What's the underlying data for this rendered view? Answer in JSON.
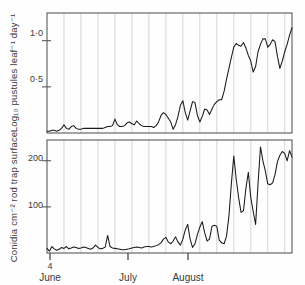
{
  "figure": {
    "background": "#fefefe",
    "line_color": "#1a1a1a",
    "grid_color": "#c4c4c4",
    "frame_color": "#4a4a4a"
  },
  "xaxis": {
    "month_labels": [
      "June",
      "July",
      "August"
    ],
    "day_label": "4",
    "tick_positions_px": [
      50,
      128,
      188
    ],
    "range_label": "4 June - September"
  },
  "panels": [
    {
      "id": "pustules",
      "ylabel": "Log₁₀ pustules leaf⁻¹ day⁻¹",
      "yticks": [
        "0·5",
        "1·0"
      ],
      "ytick_values": [
        0.5,
        1.0
      ]
    },
    {
      "id": "conidia",
      "ylabel": "Conidia cm⁻² rod trap surface",
      "yticks": [
        "100",
        "200"
      ],
      "ytick_values": [
        100,
        200
      ]
    }
  ],
  "chart_data": [
    {
      "type": "line",
      "title": "",
      "xlabel": "",
      "ylabel": "Log10 pustules leaf-1 day-1",
      "xlim": [
        0,
        101
      ],
      "ylim": [
        0,
        1.3
      ],
      "yticks": [
        0.5,
        1.0
      ],
      "ytick_labels": [
        "0·5",
        "1·0"
      ],
      "grid": "vertical-weekly",
      "legend": "none",
      "xtick_labels": [
        "4 June",
        "July",
        "August"
      ],
      "xtick_values": [
        0,
        27,
        58
      ],
      "x": [
        0,
        1,
        2,
        3,
        4,
        5,
        6,
        7,
        8,
        9,
        10,
        11,
        12,
        13,
        14,
        15,
        16,
        17,
        18,
        19,
        20,
        21,
        22,
        23,
        24,
        25,
        26,
        27,
        28,
        29,
        30,
        31,
        32,
        33,
        34,
        35,
        36,
        37,
        38,
        39,
        40,
        41,
        42,
        43,
        44,
        45,
        46,
        47,
        48,
        49,
        50,
        51,
        52,
        53,
        54,
        55,
        56,
        57,
        58,
        59,
        60,
        61,
        62,
        63,
        64,
        65,
        66,
        67,
        68,
        69,
        70,
        71,
        72,
        73,
        74,
        75,
        76,
        77,
        78,
        79,
        80,
        81,
        82,
        83,
        84,
        85,
        86,
        87,
        88,
        89,
        90,
        91,
        92,
        93,
        94,
        95,
        96,
        97,
        98,
        99,
        100,
        101
      ],
      "values": [
        0.02,
        0.02,
        0.03,
        0.03,
        0.02,
        0.03,
        0.05,
        0.09,
        0.05,
        0.04,
        0.07,
        0.08,
        0.05,
        0.04,
        0.04,
        0.05,
        0.05,
        0.05,
        0.05,
        0.05,
        0.05,
        0.05,
        0.05,
        0.05,
        0.06,
        0.07,
        0.07,
        0.08,
        0.15,
        0.09,
        0.07,
        0.07,
        0.08,
        0.11,
        0.12,
        0.1,
        0.09,
        0.13,
        0.1,
        0.08,
        0.07,
        0.07,
        0.07,
        0.07,
        0.06,
        0.08,
        0.12,
        0.19,
        0.22,
        0.2,
        0.16,
        0.12,
        0.04,
        0.09,
        0.18,
        0.3,
        0.35,
        0.22,
        0.14,
        0.24,
        0.34,
        0.33,
        0.19,
        0.12,
        0.18,
        0.26,
        0.25,
        0.2,
        0.26,
        0.31,
        0.34,
        0.36,
        0.36,
        0.45,
        0.58,
        0.7,
        0.82,
        0.93,
        0.97,
        0.95,
        0.94,
        0.98,
        0.92,
        0.84,
        0.78,
        0.66,
        0.72,
        0.88,
        0.96,
        1.02,
        1.02,
        0.93,
        0.96,
        1.01,
        0.99,
        0.83,
        0.7,
        0.78,
        0.88,
        0.96,
        1.06,
        1.14
      ]
    },
    {
      "type": "line",
      "title": "",
      "xlabel": "",
      "ylabel": "Conidia cm-2 rod trap surface",
      "xlim": [
        0,
        101
      ],
      "ylim": [
        0,
        245
      ],
      "yticks": [
        100,
        200
      ],
      "ytick_labels": [
        "100",
        "200"
      ],
      "grid": "vertical-weekly",
      "legend": "none",
      "xtick_labels": [
        "4 June",
        "July",
        "August"
      ],
      "xtick_values": [
        0,
        27,
        58
      ],
      "x": [
        0,
        1,
        2,
        3,
        4,
        5,
        6,
        7,
        8,
        9,
        10,
        11,
        12,
        13,
        14,
        15,
        16,
        17,
        18,
        19,
        20,
        21,
        22,
        23,
        24,
        25,
        26,
        27,
        28,
        29,
        30,
        31,
        32,
        33,
        34,
        35,
        36,
        37,
        38,
        39,
        40,
        41,
        42,
        43,
        44,
        45,
        46,
        47,
        48,
        49,
        50,
        51,
        52,
        53,
        54,
        55,
        56,
        57,
        58,
        59,
        60,
        61,
        62,
        63,
        64,
        65,
        66,
        67,
        68,
        69,
        70,
        71,
        72,
        73,
        74,
        75,
        76,
        77,
        78,
        79,
        80,
        81,
        82,
        83,
        84,
        85,
        86,
        87,
        88,
        89,
        90,
        91,
        92,
        93,
        94,
        95,
        96,
        97,
        98,
        99,
        100,
        101
      ],
      "values": [
        10,
        4,
        14,
        9,
        6,
        8,
        12,
        10,
        14,
        9,
        11,
        13,
        12,
        10,
        11,
        13,
        12,
        10,
        8,
        11,
        17,
        12,
        9,
        10,
        13,
        38,
        14,
        11,
        10,
        9,
        8,
        7,
        7,
        8,
        9,
        11,
        12,
        13,
        12,
        11,
        13,
        14,
        14,
        13,
        14,
        16,
        18,
        22,
        30,
        34,
        24,
        20,
        26,
        35,
        24,
        17,
        30,
        50,
        62,
        30,
        12,
        20,
        40,
        56,
        68,
        44,
        26,
        30,
        58,
        60,
        58,
        28,
        22,
        20,
        36,
        80,
        150,
        210,
        160,
        120,
        88,
        92,
        140,
        175,
        120,
        90,
        62,
        150,
        230,
        200,
        178,
        150,
        148,
        152,
        170,
        198,
        212,
        220,
        216,
        200,
        222,
        208
      ]
    }
  ]
}
